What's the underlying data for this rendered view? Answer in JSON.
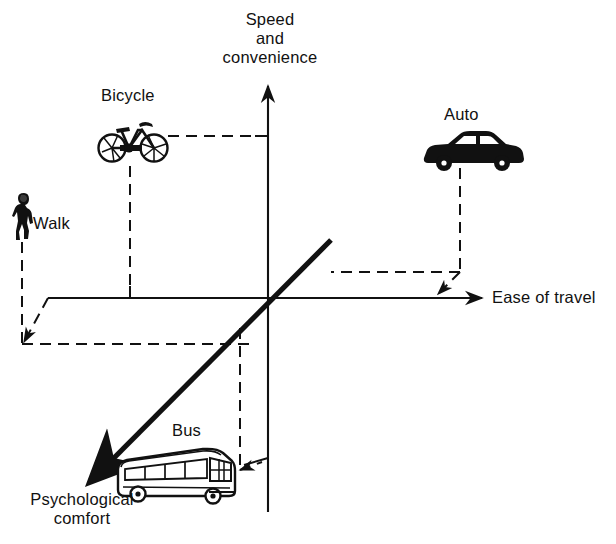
{
  "diagram": {
    "background_color": "#ffffff",
    "line_color": "#111111",
    "axes": {
      "y": {
        "name": "speed-and-convenience-axis",
        "label": "Speed\nand\nconvenience",
        "label_lines": [
          "Speed",
          "and",
          "convenience"
        ],
        "direction": "up"
      },
      "x": {
        "name": "ease-of-travel-axis",
        "label": "Ease of travel",
        "direction": "right"
      },
      "z": {
        "name": "psychological-comfort-axis",
        "label": "Psychological\ncomfort",
        "label_lines": [
          "Psychological",
          "comfort"
        ],
        "direction": "down-left"
      }
    },
    "items": [
      {
        "id": "bicycle",
        "label": "Bicycle",
        "icon": "bicycle-icon",
        "quadrant": "upper-left",
        "speed_and_convenience": "medium-high",
        "ease_of_travel": "negative",
        "psychological_comfort": "neutral"
      },
      {
        "id": "auto",
        "label": "Auto",
        "icon": "car-icon",
        "quadrant": "upper-right",
        "speed_and_convenience": "high",
        "ease_of_travel": "high",
        "psychological_comfort": "positive"
      },
      {
        "id": "walk",
        "label": "Walk",
        "icon": "pedestrian-icon",
        "quadrant": "left",
        "speed_and_convenience": "low",
        "ease_of_travel": "very-negative",
        "psychological_comfort": "negative"
      },
      {
        "id": "bus",
        "label": "Bus",
        "icon": "bus-icon",
        "quadrant": "lower-left",
        "speed_and_convenience": "low",
        "ease_of_travel": "negative",
        "psychological_comfort": "very-negative"
      }
    ]
  }
}
